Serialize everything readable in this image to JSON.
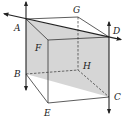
{
  "figure": {
    "type": "cube-with-plane",
    "points": {
      "A": {
        "label": "A",
        "x": 26,
        "y": 19,
        "lx": 14,
        "ly": 31
      },
      "G": {
        "label": "G",
        "x": 78,
        "y": 17,
        "lx": 73,
        "ly": 13
      },
      "D": {
        "label": "D",
        "x": 109,
        "y": 37,
        "lx": 113,
        "ly": 34
      },
      "F": {
        "label": "F",
        "x": 48,
        "y": 40,
        "lx": 35,
        "ly": 51
      },
      "B": {
        "label": "B",
        "x": 26,
        "y": 74,
        "lx": 14,
        "ly": 77
      },
      "H": {
        "label": "H",
        "x": 78,
        "y": 70,
        "lx": 83,
        "ly": 69
      },
      "C": {
        "label": "C",
        "x": 109,
        "y": 97,
        "lx": 114,
        "ly": 100
      },
      "E": {
        "label": "E",
        "x": 48,
        "y": 103,
        "lx": 44,
        "ly": 116
      }
    },
    "shaded_plane": [
      "A",
      "D",
      "C",
      "B"
    ],
    "shade_color": "#c8c8c8",
    "line_color": "#222222",
    "lines": [
      {
        "name": "line-AD",
        "through": [
          "A",
          "D"
        ],
        "arrows": "both"
      },
      {
        "name": "line-AB",
        "through": [
          "A",
          "B"
        ],
        "arrows": "both"
      },
      {
        "name": "line-DC",
        "through": [
          "D",
          "C"
        ],
        "arrows": "both"
      }
    ],
    "visible_edges": [
      [
        "A",
        "G"
      ],
      [
        "G",
        "D"
      ],
      [
        "A",
        "F"
      ],
      [
        "F",
        "D"
      ],
      [
        "F",
        "E"
      ],
      [
        "B",
        "E"
      ],
      [
        "E",
        "C"
      ]
    ],
    "hidden_edges": [
      [
        "G",
        "H"
      ],
      [
        "B",
        "H"
      ],
      [
        "H",
        "C"
      ]
    ]
  }
}
